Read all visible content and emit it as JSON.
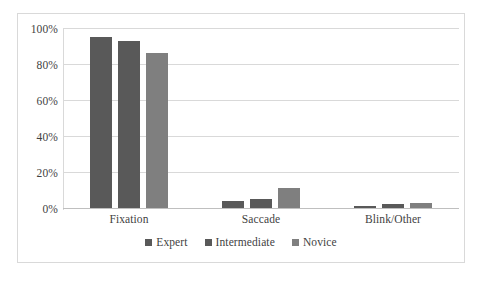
{
  "chart_data": {
    "type": "bar",
    "title": "",
    "subtitle": "",
    "xlabel": "",
    "ylabel": "",
    "categories": [
      "Fixation",
      "Saccade",
      "Blink/Other"
    ],
    "series": [
      {
        "name": "Expert",
        "color": "#595959",
        "values": [
          95,
          4,
          1
        ]
      },
      {
        "name": "Intermediate",
        "color": "#595959",
        "values": [
          93,
          5,
          2
        ]
      },
      {
        "name": "Novice",
        "color": "#7f7f7f",
        "values": [
          86,
          11,
          3
        ]
      }
    ],
    "ylim": [
      0,
      100
    ],
    "y_ticks": [
      0,
      20,
      40,
      60,
      80,
      100
    ],
    "y_tick_labels": [
      "0%",
      "20%",
      "40%",
      "60%",
      "80%",
      "100%"
    ],
    "value_suffix": "%",
    "grid": true,
    "grid_axis": "y",
    "legend_position": "bottom",
    "plot_border": true,
    "colors": {
      "grid": "#d9d9d9",
      "axis": "#bfbfbf",
      "border": "#d9d9d9",
      "text": "#3f3f3f",
      "background": "#ffffff"
    }
  }
}
